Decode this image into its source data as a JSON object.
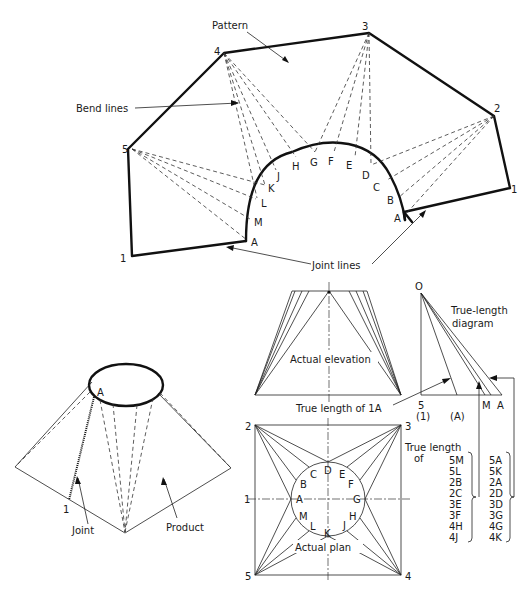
{
  "pattern_view": {
    "title_label": "Pattern",
    "bend_lines_label": "Bend lines",
    "joint_lines_label": "Joint lines",
    "corner_labels": [
      "1",
      "5",
      "4",
      "3",
      "2",
      "1"
    ],
    "arc_labels": [
      "A",
      "M",
      "L",
      "K",
      "J",
      "H",
      "G",
      "F",
      "E",
      "D",
      "C",
      "B",
      "A"
    ]
  },
  "product_view": {
    "point_a": "A",
    "point_1": "1",
    "joint_label": "Joint",
    "product_label": "Product"
  },
  "elevation_view": {
    "label": "Actual elevation",
    "true_length_label": "True length of 1A"
  },
  "true_length_diagram": {
    "title_line1": "True-length",
    "title_line2": "diagram",
    "origin": "O",
    "base_labels": [
      "5",
      "(1)",
      "(A)",
      "M",
      "A"
    ]
  },
  "plan_view": {
    "label": "Actual plan",
    "corners": {
      "c1": "1",
      "c2": "2",
      "c3": "3",
      "c4": "4",
      "c5": "5"
    },
    "circle_points": [
      "A",
      "B",
      "C",
      "D",
      "E",
      "F",
      "G",
      "H",
      "J",
      "K",
      "L",
      "M"
    ]
  },
  "true_length_table": {
    "heading_line1": "True length",
    "heading_line2": "of",
    "group_m": [
      "5M",
      "5L",
      "2B",
      "2C",
      "3E",
      "3F",
      "4H",
      "4J"
    ],
    "group_a": [
      "5A",
      "5K",
      "2A",
      "2D",
      "3D",
      "3G",
      "4G",
      "4K"
    ]
  }
}
